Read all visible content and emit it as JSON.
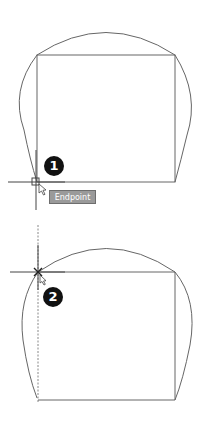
{
  "figure": {
    "steps": [
      {
        "id": 1,
        "label": "1",
        "tooltip": "Endpoint"
      },
      {
        "id": 2,
        "label": "2"
      }
    ]
  },
  "colors": {
    "line": "#555555",
    "tooltip_bg": "#9a9a9a",
    "badge_bg": "#111111",
    "badge_text": "#ffffff"
  }
}
